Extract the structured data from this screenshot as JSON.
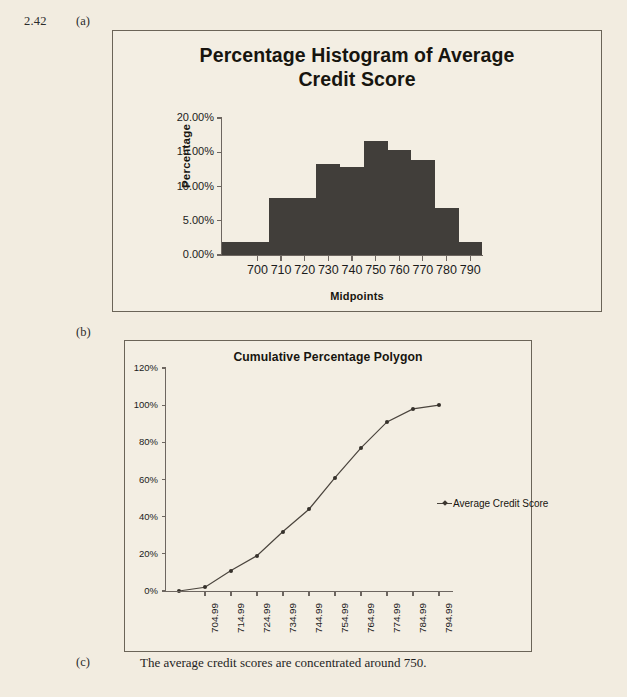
{
  "problem": {
    "number": "2.42",
    "part_a_label": "(a)",
    "part_b_label": "(b)",
    "part_c_label": "(c)",
    "part_c_text": "The average credit scores are concentrated around 750."
  },
  "colors": {
    "page_background": "#f2ece0",
    "bar_fill": "#413e3a",
    "frame_border": "#6b6458",
    "axis": "#6d6660",
    "line_series": "#4a443d",
    "text": "#17150f"
  },
  "histogram": {
    "title": "Percentage Histogram of Average Credit Score",
    "title_line1": "Percentage Histogram of Average",
    "title_line2": "Credit Score",
    "y_axis_title": "Percentage",
    "x_axis_title": "Midpoints",
    "y_ticks": [
      "0.00%",
      "5.00%",
      "10.00%",
      "15.00%",
      "20.00%"
    ],
    "x_ticks": [
      "700",
      "710",
      "720",
      "730",
      "740",
      "750",
      "760",
      "770",
      "780",
      "790"
    ]
  },
  "polygon": {
    "title": "Cumulative Percentage Polygon",
    "y_ticks": [
      "0%",
      "20%",
      "40%",
      "60%",
      "80%",
      "100%",
      "120%"
    ],
    "x_ticks": [
      "704.99",
      "714.99",
      "724.99",
      "734.99",
      "744.99",
      "754.99",
      "764.99",
      "774.99",
      "784.99",
      "794.99"
    ],
    "legend": {
      "marker": "line-marker-icon",
      "label": "Average Credit Score"
    }
  },
  "chart_data": [
    {
      "type": "bar",
      "title": "Percentage Histogram of Average Credit Score",
      "xlabel": "Midpoints",
      "ylabel": "Percentage",
      "categories": [
        695,
        700,
        710,
        720,
        730,
        740,
        750,
        760,
        770,
        780,
        790
      ],
      "tick_labels": [
        "700",
        "710",
        "720",
        "730",
        "740",
        "750",
        "760",
        "770",
        "780",
        "790"
      ],
      "values": [
        1.9,
        1.9,
        8.3,
        8.3,
        13.3,
        12.8,
        16.7,
        15.3,
        13.9,
        6.9,
        1.9
      ],
      "bars": [
        {
          "midpoint": 700,
          "percentage": 1.9
        },
        {
          "midpoint": 710,
          "percentage": 8.3
        },
        {
          "midpoint": 720,
          "percentage": 8.3
        },
        {
          "midpoint": 730,
          "percentage": 13.3
        },
        {
          "midpoint": 740,
          "percentage": 12.8
        },
        {
          "midpoint": 750,
          "percentage": 16.7
        },
        {
          "midpoint": 760,
          "percentage": 15.3
        },
        {
          "midpoint": 770,
          "percentage": 13.9
        },
        {
          "midpoint": 780,
          "percentage": 6.9
        },
        {
          "midpoint": 790,
          "percentage": 1.9
        }
      ],
      "ylim": [
        0,
        20
      ],
      "ytick_values": [
        0,
        5,
        10,
        15,
        20
      ],
      "grid": false,
      "legend": "none"
    },
    {
      "type": "line",
      "title": "Cumulative Percentage Polygon",
      "xlabel": "",
      "ylabel": "",
      "categories": [
        "694.99",
        "704.99",
        "714.99",
        "724.99",
        "734.99",
        "744.99",
        "754.99",
        "764.99",
        "774.99",
        "784.99",
        "794.99"
      ],
      "series": [
        {
          "name": "Average Credit Score",
          "values": [
            0,
            2,
            11,
            19,
            32,
            44,
            61,
            77,
            91,
            98,
            100
          ]
        }
      ],
      "ylim": [
        0,
        120
      ],
      "ytick_values": [
        0,
        20,
        40,
        60,
        80,
        100,
        120
      ],
      "grid": false,
      "legend_position": "right"
    }
  ]
}
